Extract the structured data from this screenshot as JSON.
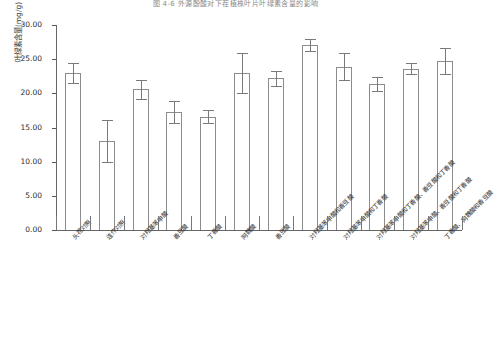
{
  "figure": {
    "title": "图 4-6  外源酚酸对下茬植株叶片叶绿素含量的影响",
    "ylabel": "叶绿素含量(mg/g)",
    "xlabel": ""
  },
  "axis": {
    "y_ticks": [
      "0.00",
      "5.00",
      "10.00",
      "15.00",
      "20.00",
      "25.00",
      "30.00"
    ],
    "y_min": 0.0,
    "y_max": 30.0,
    "y_step": 5.0
  },
  "chart_data": {
    "type": "bar",
    "title": "图 4-6  外源酚酸对下茬植株叶片叶绿素含量的影响",
    "xlabel": "",
    "ylabel": "叶绿素含量(mg/g)",
    "ylim": [
      0.0,
      30.0
    ],
    "ytick_step": 5.0,
    "grid": false,
    "legend": "none",
    "error_bars": "standard deviation",
    "categories": [
      "头茬对照",
      "连作对照",
      "对羟基苯甲酸",
      "香豆酸",
      "丁香酸",
      "阿魏酸",
      "香豆酸",
      "对羟基苯甲酸和香豆酸",
      "对羟基苯甲酸和丁香酸",
      "对羟基苯甲酸和丁香酸、香豆酸和丁香酸",
      "对羟基苯甲酸、香豆酸和丁香酸",
      "丁香酸、阿魏酸和香豆酸"
    ],
    "values": [
      23.0,
      13.0,
      20.6,
      17.3,
      16.6,
      23.0,
      22.2,
      27.1,
      23.9,
      21.4,
      23.6,
      24.7
    ],
    "errors": [
      1.5,
      3.1,
      1.4,
      1.6,
      0.9,
      2.9,
      1.1,
      0.9,
      2.0,
      1.0,
      0.8,
      1.9
    ]
  }
}
